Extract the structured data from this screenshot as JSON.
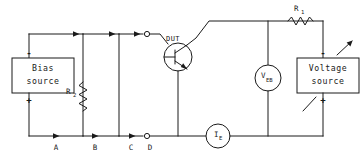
{
  "diagram": {
    "line_color": "#1a1a1a",
    "background": "#ffffff"
  },
  "blocks": {
    "bias_source": {
      "line1": "Bias",
      "line2": "source",
      "terminal_top": "-",
      "terminal_bottom": "+"
    },
    "voltage_source": {
      "line1": "Voltage",
      "line2": "source",
      "terminal_top": "-",
      "terminal_bottom": "+"
    }
  },
  "components": {
    "r1": {
      "label": "R",
      "subscript": "1",
      "type": "resistor-horizontal"
    },
    "r2": {
      "label": "R",
      "subscript": "2",
      "type": "resistor-vertical"
    },
    "veb": {
      "label": "V",
      "subscript": "EB",
      "type": "voltmeter"
    },
    "ie": {
      "label": "I",
      "subscript": "E",
      "type": "ammeter"
    },
    "dut": {
      "label": "DUT",
      "type": "transistor"
    }
  },
  "nodes": {
    "a": "A",
    "b": "B",
    "c": "C",
    "d": "D"
  }
}
